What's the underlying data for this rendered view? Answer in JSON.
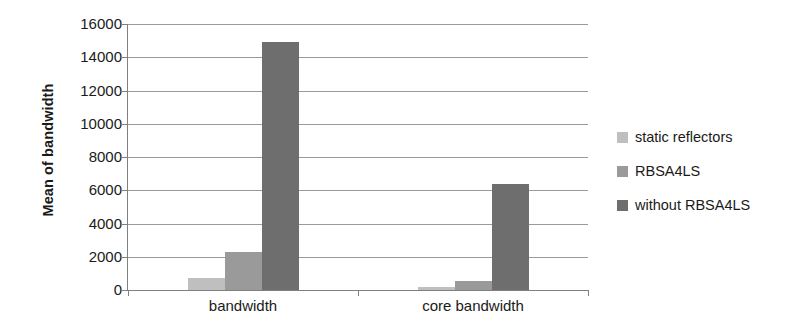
{
  "chart_data": {
    "type": "bar",
    "title": "",
    "subtitle": "",
    "xlabel": "",
    "ylabel": "Mean of bandwidth",
    "categories": [
      "bandwidth",
      "core bandwidth"
    ],
    "series": [
      {
        "name": "static reflectors",
        "color": "#bfbfbf",
        "values": [
          720,
          180
        ]
      },
      {
        "name": "RBSA4LS",
        "color": "#9a9a9a",
        "values": [
          2300,
          540
        ]
      },
      {
        "name": "without RBSA4LS",
        "color": "#6e6e6e",
        "values": [
          14900,
          6350
        ]
      }
    ],
    "ylim": [
      0,
      16000
    ],
    "ytick_step": 2000,
    "ytick_labels": [
      "16000",
      "14000",
      "12000",
      "10000",
      "8000",
      "6000",
      "4000",
      "2000",
      "0"
    ],
    "ytick_values": [
      16000,
      14000,
      12000,
      10000,
      8000,
      6000,
      4000,
      2000,
      0
    ],
    "grid": true,
    "grid_color": "#9a9a9a",
    "axis_color": "#808080",
    "legend_position": "right",
    "background": "#ffffff"
  }
}
